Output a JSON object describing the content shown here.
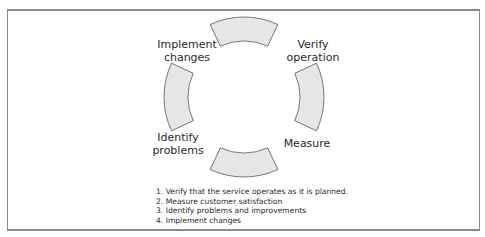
{
  "diagram": {
    "type": "cycle",
    "segments": [
      {
        "position": "top",
        "label": "Verify operation",
        "label_lines": [
          "Verify",
          "operation"
        ]
      },
      {
        "position": "right",
        "label": "Measure",
        "label_lines": [
          "Measure"
        ]
      },
      {
        "position": "bottom",
        "label": "Identify problems",
        "label_lines": [
          "Identify",
          "problems"
        ]
      },
      {
        "position": "left",
        "label": "Implement changes",
        "label_lines": [
          "Implement",
          "changes"
        ]
      }
    ],
    "labels": {
      "implement_1": "Implement",
      "implement_2": "changes",
      "verify_1": "Verify",
      "verify_2": "operation",
      "identify_1": "Identify",
      "identify_2": "problems",
      "measure": "Measure"
    },
    "colors": {
      "segment_fill": "#e6e6e6",
      "segment_stroke": "#555555",
      "frame": "#8a8a8a"
    }
  },
  "steps": [
    "1. Verify that the service operates as it is planned.",
    "2. Measure customer satisfaction",
    "3. Identify problems and improvements",
    "4. Implement changes"
  ]
}
